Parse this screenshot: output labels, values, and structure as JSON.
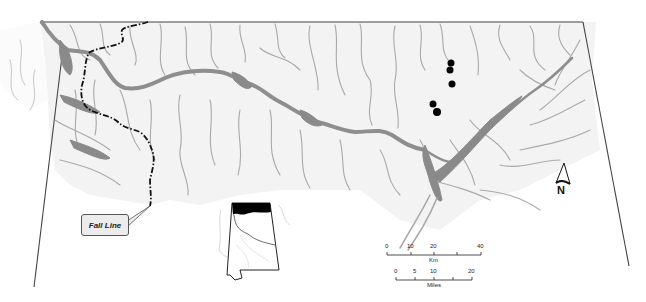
{
  "map": {
    "type": "regional hydrologic map",
    "labels": {
      "fall_line": "Fall Line",
      "north": "N"
    },
    "colors": {
      "land": "#f2f2f2",
      "rivers": "#a9a9a9",
      "main_river_lakes": "#8a8a8a",
      "fall_line": "#111111",
      "sites": "#000000",
      "inset_highlight": "#000000"
    },
    "site_markers": [
      {
        "x": 451,
        "y": 63
      },
      {
        "x": 450,
        "y": 70
      },
      {
        "x": 452,
        "y": 84
      },
      {
        "x": 433,
        "y": 104
      },
      {
        "x": 437,
        "y": 112
      }
    ],
    "scale_bar": {
      "km": {
        "ticks": [
          "0",
          "10",
          "20",
          "40"
        ],
        "unit": "Km"
      },
      "miles": {
        "ticks": [
          "0",
          "5",
          "10",
          "20"
        ],
        "unit": "Miles"
      }
    },
    "inset": {
      "description": "State outline with northern region highlighted in black"
    }
  }
}
